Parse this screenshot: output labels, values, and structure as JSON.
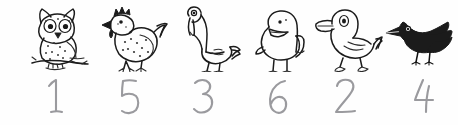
{
  "page": {
    "background_color": "#fefefe",
    "ink_color": "#1b1b1b",
    "pencil_color": "#9a9a9e",
    "width": 458,
    "height": 125
  },
  "items": [
    {
      "bird_name": "owl",
      "icon": "owl-sketch",
      "number_label": "1",
      "number_glyph": "one"
    },
    {
      "bird_name": "hen",
      "icon": "hen-sketch",
      "number_label": "5",
      "number_glyph": "five"
    },
    {
      "bird_name": "goose",
      "icon": "goose-sketch",
      "number_label": "3",
      "number_glyph": "three"
    },
    {
      "bird_name": "chick",
      "icon": "chick-sketch",
      "number_label": "6",
      "number_glyph": "six"
    },
    {
      "bird_name": "duck",
      "icon": "duck-sketch",
      "number_label": "2",
      "number_glyph": "two"
    },
    {
      "bird_name": "crow",
      "icon": "crow-sketch",
      "number_label": "4",
      "number_glyph": "four"
    }
  ]
}
